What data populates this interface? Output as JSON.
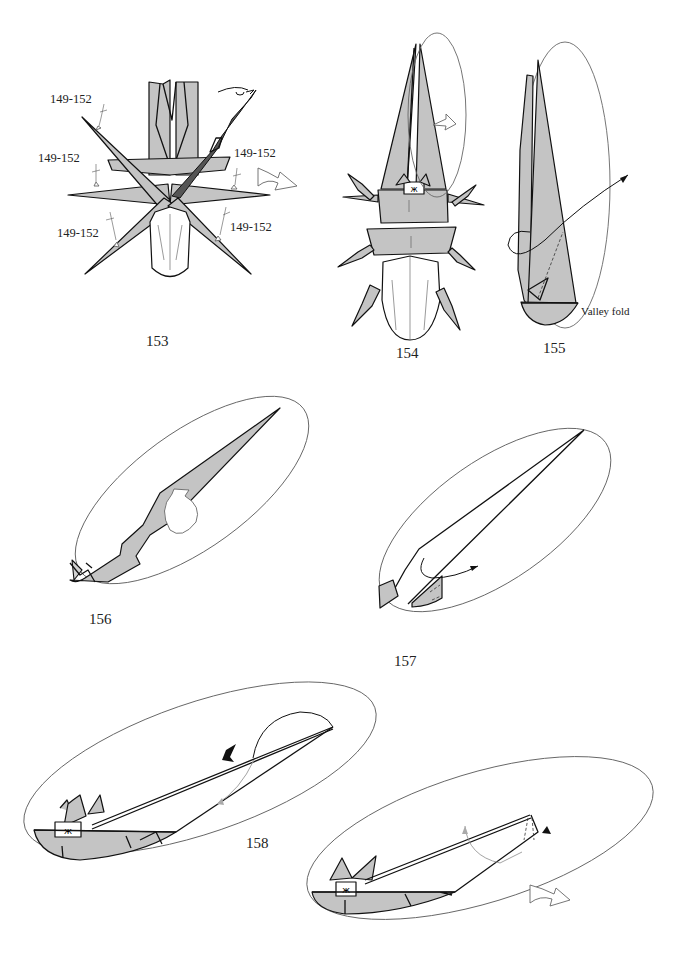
{
  "page": {
    "type": "origami-instructions",
    "background": "#ffffff",
    "paper_color": "#c4c4c4"
  },
  "steps": [
    {
      "number": "153",
      "labels": [
        "149-152",
        "149-152",
        "149-152",
        "149-152",
        "149-152",
        "149-152"
      ],
      "symbols": [
        "turn-over-icon",
        "repeat-push-arrow-icon",
        "valley-fold-marks"
      ]
    },
    {
      "number": "154",
      "symbols": [
        "zoom-circle",
        "unfold-arrow-icon"
      ]
    },
    {
      "number": "155",
      "labels": [
        "Valley fold"
      ],
      "symbols": [
        "fold-arrow",
        "dashed-fold-line"
      ]
    },
    {
      "number": "156",
      "symbols": [
        "rotate-arrow-icon"
      ]
    },
    {
      "number": "157",
      "symbols": [
        "fold-arrow"
      ]
    },
    {
      "number": "158",
      "symbols": [
        "push-arrow-icon",
        "fold-arrow",
        "repeat-arrow-icon"
      ]
    }
  ]
}
